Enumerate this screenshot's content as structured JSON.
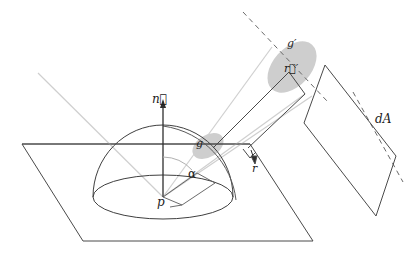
{
  "figure": {
    "labels": {
      "normal": "n⃗",
      "normal_plain": "n",
      "solid_angle_small": "g",
      "solid_angle_projected": "g′",
      "direction_vector_projected": "r⃗′",
      "distance": "r",
      "angle": "α",
      "point": "p",
      "area_element": "dA"
    },
    "colors": {
      "stroke_dark": "#3a3a3a",
      "stroke_mid": "#555555",
      "stroke_light": "#c9c9c9",
      "patch_fill": "#b9b9b9",
      "background": "#ffffff",
      "text": "#1b1b1b"
    },
    "geometry": {
      "ground_plane": [
        [
          22,
          144
        ],
        [
          250,
          144
        ],
        [
          313,
          241
        ],
        [
          83,
          241
        ]
      ],
      "hemisphere_center": [
        163,
        197
      ],
      "hemisphere_radius_x": 70,
      "hemisphere_radius_y": 72,
      "base_ellipse_ry": 22,
      "normal_tip": [
        163,
        101
      ],
      "area_plane": [
        [
          325,
          65
        ],
        [
          396,
          156
        ],
        [
          376,
          216
        ],
        [
          304,
          123
        ]
      ],
      "patch_small_center": [
        208,
        145
      ],
      "patch_large_center": [
        291,
        66
      ]
    }
  }
}
